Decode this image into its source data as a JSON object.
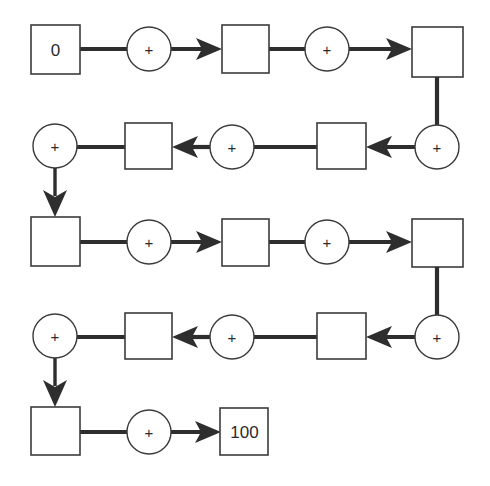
{
  "diagram": {
    "type": "flow-chain",
    "background_color": "#ffffff",
    "stroke_color": "#3b3b3b",
    "line_color": "#2e2e2e",
    "box_fill": "#ffffff",
    "operator_symbol": "+",
    "start_value": "0",
    "end_value": "100",
    "rows": [
      {
        "index": 1,
        "direction": "left-to-right",
        "nodes": [
          {
            "id": "box-1",
            "shape": "square",
            "label": "0"
          },
          {
            "id": "op-1",
            "shape": "circle",
            "label": "+"
          },
          {
            "id": "box-2",
            "shape": "square",
            "label": ""
          },
          {
            "id": "op-2",
            "shape": "circle",
            "label": "+"
          },
          {
            "id": "box-3",
            "shape": "square",
            "label": ""
          }
        ]
      },
      {
        "index": 2,
        "direction": "right-to-left",
        "nodes": [
          {
            "id": "op-3",
            "shape": "circle",
            "label": "+"
          },
          {
            "id": "box-4",
            "shape": "square",
            "label": ""
          },
          {
            "id": "op-4",
            "shape": "circle",
            "label": "+"
          },
          {
            "id": "box-5",
            "shape": "square",
            "label": ""
          },
          {
            "id": "op-5",
            "shape": "circle",
            "label": "+"
          }
        ]
      },
      {
        "index": 3,
        "direction": "left-to-right",
        "nodes": [
          {
            "id": "box-6",
            "shape": "square",
            "label": ""
          },
          {
            "id": "op-6",
            "shape": "circle",
            "label": "+"
          },
          {
            "id": "box-7",
            "shape": "square",
            "label": ""
          },
          {
            "id": "op-7",
            "shape": "circle",
            "label": "+"
          },
          {
            "id": "box-8",
            "shape": "square",
            "label": ""
          }
        ]
      },
      {
        "index": 4,
        "direction": "right-to-left",
        "nodes": [
          {
            "id": "op-8",
            "shape": "circle",
            "label": "+"
          },
          {
            "id": "box-9",
            "shape": "square",
            "label": ""
          },
          {
            "id": "op-9",
            "shape": "circle",
            "label": "+"
          },
          {
            "id": "box-10",
            "shape": "square",
            "label": ""
          },
          {
            "id": "op-10",
            "shape": "circle",
            "label": "+"
          }
        ]
      },
      {
        "index": 5,
        "direction": "left-to-right",
        "nodes": [
          {
            "id": "box-11",
            "shape": "square",
            "label": ""
          },
          {
            "id": "op-11",
            "shape": "circle",
            "label": "+"
          },
          {
            "id": "box-12",
            "shape": "square",
            "label": "100"
          }
        ]
      }
    ],
    "labels": {
      "start": "0",
      "finish": "100",
      "plus_1": "+",
      "plus_2": "+",
      "plus_3": "+",
      "plus_4": "+",
      "plus_5": "+",
      "plus_6": "+",
      "plus_7": "+",
      "plus_8": "+",
      "plus_9": "+",
      "plus_10": "+",
      "plus_11": "+",
      "empty_1": "",
      "empty_2": "",
      "empty_3": "",
      "empty_4": "",
      "empty_5": "",
      "empty_6": "",
      "empty_7": "",
      "empty_8": "",
      "empty_9": "",
      "empty_10": ""
    }
  }
}
